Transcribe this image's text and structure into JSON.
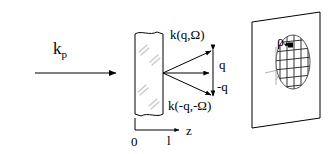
{
  "figure": {
    "background_color": "#ffffff",
    "stroke_color": "#000000",
    "hatch_color": "#c8c8c8",
    "width": 334,
    "height": 154
  },
  "labels": {
    "incident_wave": "k",
    "incident_wave_subscript": "p",
    "scattered_up": "k(q,Ω)",
    "scattered_down": "k(-q,-Ω)",
    "momentum_up": "q",
    "momentum_down": "-q",
    "axis_z": "z",
    "axis_origin": "0",
    "axis_thickness": "l",
    "screen_position": "ρ"
  },
  "elements": {
    "slab": {
      "name": "scattering-medium-slab",
      "x": 135,
      "y": 32,
      "width": 28,
      "height": 86,
      "hatch_marks": 8
    },
    "incident_arrow": {
      "name": "incident-beam-arrow",
      "x1": 35,
      "y1": 73,
      "x2": 118,
      "y2": 73
    },
    "scatter_origin": {
      "x": 163,
      "y": 73
    },
    "scattered_rays": [
      {
        "name": "scattered-ray-up",
        "x2": 213,
        "y2": 50
      },
      {
        "name": "scattered-ray-center",
        "x2": 211,
        "y2": 73
      },
      {
        "name": "scattered-ray-down",
        "x2": 213,
        "y2": 96
      }
    ],
    "momentum_axis": {
      "name": "momentum-transfer-axis",
      "x": 213,
      "y_top": 48,
      "y_bottom": 98
    },
    "z_axis": {
      "name": "z-axis",
      "bracket_x": 135,
      "bracket_y": 118,
      "baseline_y": 130,
      "arrow_x": 181
    },
    "screen": {
      "name": "observation-screen",
      "points": "252,22 320,12 320,118 252,128"
    },
    "speckle": {
      "name": "speckle-pattern-ellipse",
      "cx": 293,
      "cy": 62,
      "rx": 17,
      "ry": 27,
      "grid_rows": 7,
      "grid_cols": 5
    },
    "speckle_marker": {
      "name": "speckle-point-marker",
      "x": 290,
      "y": 45,
      "size": 5
    }
  }
}
